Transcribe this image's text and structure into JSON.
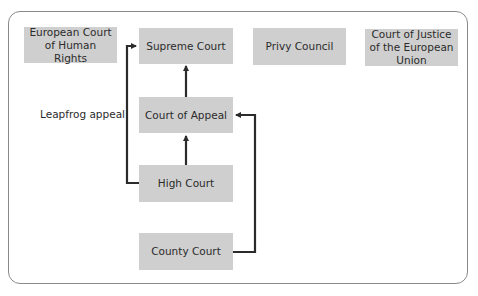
{
  "diagram": {
    "title": "",
    "nodes": {
      "echr": "European Court of Human Rights",
      "supreme": "Supreme Court",
      "privy": "Privy Council",
      "cjeu": "Court of Justice of the European Union",
      "appeal": "Court of Appeal",
      "high": "High Court",
      "county": "County Court"
    },
    "annotations": {
      "leapfrog": "Leapfrog appeal"
    },
    "edges": [
      {
        "from": "appeal",
        "to": "supreme"
      },
      {
        "from": "high",
        "to": "appeal"
      },
      {
        "from": "high",
        "to": "supreme",
        "label": "Leapfrog appeal"
      },
      {
        "from": "county",
        "to": "appeal"
      }
    ],
    "colors": {
      "box_fill": "#cfcfcf",
      "line": "#2b2b2b",
      "frame": "#8a8a8a"
    }
  }
}
